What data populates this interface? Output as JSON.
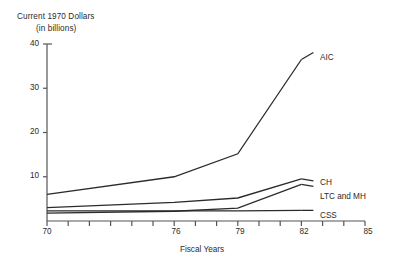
{
  "chart_data": {
    "type": "line",
    "title": "Current 1970 Dollars",
    "subtitle": "(in billions)",
    "xlabel": "Fiscal Years",
    "ylabel": "",
    "xlim": [
      70,
      85
    ],
    "ylim": [
      0,
      40
    ],
    "yticks": [
      10,
      20,
      30,
      40
    ],
    "ytick_labels": [
      "10",
      "20",
      "30",
      "40"
    ],
    "xticks": [
      70,
      71,
      72,
      73,
      74,
      75,
      76,
      77,
      78,
      79,
      80,
      81,
      82,
      83,
      84,
      85
    ],
    "xtick_labels_shown": [
      "70",
      "76",
      "79",
      "82",
      "85"
    ],
    "grid": false,
    "legend_position": "right-inline",
    "x": [
      70,
      76,
      79,
      82
    ],
    "series": [
      {
        "name": "AIC",
        "label": "AIC",
        "values": [
          6.0,
          10.0,
          15.2,
          36.5
        ]
      },
      {
        "name": "CH",
        "label": "CH",
        "values": [
          3.0,
          4.2,
          5.2,
          9.5
        ]
      },
      {
        "name": "LTC and MH",
        "label": "LTC and MH",
        "values": [
          1.8,
          2.2,
          2.9,
          8.3
        ]
      },
      {
        "name": "CSS",
        "label": "CSS",
        "values": [
          2.3,
          2.3,
          2.3,
          2.4
        ]
      }
    ]
  },
  "axes": {
    "y_title_line1": "Current 1970 Dollars",
    "y_title_line2": "(in billions)",
    "x_title": "Fiscal Years",
    "ytick_0": "10",
    "ytick_1": "20",
    "ytick_2": "30",
    "ytick_3": "40",
    "xtick_0": "70",
    "xtick_1": "76",
    "xtick_2": "79",
    "xtick_3": "82",
    "xtick_4": "85"
  },
  "labels": {
    "aic": "AIC",
    "ch": "CH",
    "ltc_mh": "LTC and MH",
    "css": "CSS"
  },
  "colors": {
    "line": "#2b2b2b",
    "axis": "#555555",
    "text": "#2b2b2b",
    "background": "#ffffff"
  }
}
